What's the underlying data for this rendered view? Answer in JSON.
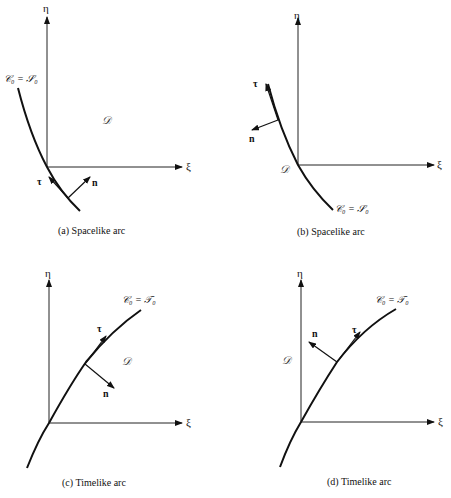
{
  "figure": {
    "panels": [
      {
        "id": "a",
        "caption": "(a) Spacelike arc",
        "axis_x": "ξ",
        "axis_y": "η",
        "curve_label": "𝒞₀ = 𝒮₀",
        "domain_label": "𝒟",
        "tangent_label": "τ",
        "normal_label": "n"
      },
      {
        "id": "b",
        "caption": "(b) Spacelike arc",
        "axis_x": "ξ",
        "axis_y": "η",
        "curve_label": "𝒞₀ = 𝒮₀",
        "domain_label": "𝒟",
        "tangent_label": "τ",
        "normal_label": "n"
      },
      {
        "id": "c",
        "caption": "(c) Timelike arc",
        "axis_x": "ξ",
        "axis_y": "η",
        "curve_label": "𝒞₀ = 𝒯₀",
        "domain_label": "𝒟",
        "tangent_label": "τ",
        "normal_label": "n"
      },
      {
        "id": "d",
        "caption": "(d) Timelike arc",
        "axis_x": "ξ",
        "axis_y": "η",
        "curve_label": "𝒞₀ = 𝒯₀",
        "domain_label": "𝒟",
        "tangent_label": "τ",
        "normal_label": "n"
      }
    ]
  }
}
